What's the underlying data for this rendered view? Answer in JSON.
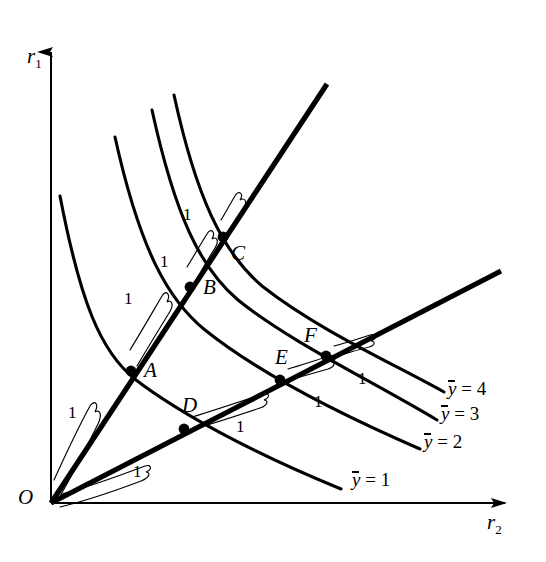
{
  "figure": {
    "type": "isoquant-map-returns-to-scale",
    "background": "#ffffff",
    "ink": "#000000"
  },
  "axes": {
    "y_axis": {
      "name": "vertical-axis",
      "label": "r",
      "sub": "1",
      "label_x": 27,
      "label_y": 46,
      "x": 51,
      "y_top": 36,
      "y_bottom": 503,
      "arrow": "up"
    },
    "x_axis": {
      "name": "horizontal-axis",
      "label": "r",
      "sub": "2",
      "label_x": 487,
      "label_y": 512,
      "x_left": 51,
      "x_right": 520,
      "y": 503,
      "arrow": "right"
    },
    "origin": {
      "label": "O",
      "x": 51,
      "y": 503,
      "label_x": 18,
      "label_y": 487
    }
  },
  "rays": [
    {
      "name": "upper-ray",
      "from": [
        51,
        503
      ],
      "to": [
        327,
        84
      ],
      "width": 5.2
    },
    {
      "name": "lower-ray",
      "from": [
        51,
        503
      ],
      "to": [
        501,
        271
      ],
      "width": 5.2
    }
  ],
  "points": [
    {
      "label": "A",
      "x": 131,
      "y": 371,
      "label_x": 144,
      "label_y": 360,
      "ray": "upper-ray",
      "isoquant": 1
    },
    {
      "label": "B",
      "x": 190,
      "y": 287,
      "label_x": 203,
      "label_y": 277,
      "ray": "upper-ray",
      "isoquant": 2
    },
    {
      "label": "C",
      "x": 223,
      "y": 237,
      "label_x": 231,
      "label_y": 243,
      "ray": "upper-ray",
      "isoquant": 3
    },
    {
      "label": "D",
      "x": 184,
      "y": 429,
      "label_x": 182,
      "label_y": 395,
      "ray": "lower-ray",
      "isoquant": 1
    },
    {
      "label": "E",
      "x": 280,
      "y": 380,
      "label_x": 275,
      "label_y": 347,
      "ray": "lower-ray",
      "isoquant": 2
    },
    {
      "label": "F",
      "x": 326,
      "y": 356,
      "label_x": 304,
      "label_y": 325,
      "ray": "lower-ray",
      "isoquant": 3
    }
  ],
  "isoquants": [
    {
      "level": 1,
      "label_text": "= 1",
      "label_x": 352,
      "label_y": 470,
      "path": "M 60,196 C 80,300 100,352 136,380 C 178,412 250,452 341,489"
    },
    {
      "level": 2,
      "label_text": "= 2",
      "label_x": 424,
      "label_y": 432,
      "path": "M 115,137 C 140,250 168,300 205,330 C 255,370 330,410 420,449"
    },
    {
      "level": 3,
      "label_text": "= 3",
      "label_x": 441,
      "label_y": 404,
      "path": "M 152,110 C 175,215 200,268 238,300 C 290,342 370,380 437,420"
    },
    {
      "level": 4,
      "label_text": "= 4",
      "label_x": 448,
      "label_y": 379,
      "path": "M 174,95 C 196,196 222,252 262,286 C 318,330 390,362 444,392"
    }
  ],
  "distance_brackets": [
    {
      "name": "bracket-O-A",
      "value": "1",
      "label_x": 68,
      "label_y": 404,
      "path": "M 57,501 C 70,480 84,452 98,424 C 103,413 99,409 95,412 C 99,404 95,399 90,406 C 78,428 64,458 54,480"
    },
    {
      "name": "bracket-A-B",
      "value": "1",
      "label_x": 124,
      "label_y": 290,
      "path": "M 137,366 C 147,349 158,331 169,313 C 175,304 171,299 167,302 C 171,294 166,289 162,296 C 152,313 141,332 130,350"
    },
    {
      "name": "bracket-B-C",
      "value": "1",
      "label_x": 160,
      "label_y": 253,
      "path": "M 195,283 C 201,271 208,259 215,248 C 220,240 216,236 212,239 C 216,232 211,227 207,234 C 200,245 194,256 187,267"
    },
    {
      "name": "bracket-C-top",
      "value": "1",
      "label_x": 183,
      "label_y": 206,
      "path": "M 229,234 C 234,225 239,216 244,208 C 248,201 244,197 240,200 C 244,194 239,189 235,196 C 230,204 226,212 221,220"
    },
    {
      "name": "bracket-O-D",
      "value": "1",
      "label_x": 133,
      "label_y": 463,
      "path": "M 60,507 C 85,501 112,492 141,481 C 151,477 150,472 146,472 C 153,469 151,464 145,466 C 116,477 88,487 62,494"
    },
    {
      "name": "bracket-D-E",
      "value": "1",
      "label_x": 236,
      "label_y": 418,
      "path": "M 190,430 C 212,424 236,416 260,408 C 269,405 268,400 264,400 C 271,397 269,392 263,394 C 239,402 215,410 192,417"
    },
    {
      "name": "bracket-E-F",
      "value": "1",
      "label_x": 314,
      "label_y": 393,
      "path": "M 286,381 C 300,377 314,373 328,369 C 336,366 335,362 331,362 C 338,359 336,354 330,356 C 316,360 302,365 288,369"
    },
    {
      "name": "bracket-F-next",
      "value": "1",
      "label_x": 358,
      "label_y": 370,
      "path": "M 333,357 C 345,354 357,350 369,347 C 376,345 375,341 371,341 C 378,338 376,333 370,335 C 358,339 346,343 334,346"
    }
  ],
  "isoquant_common": {
    "y_symbol": "y"
  },
  "chart_data": {
    "type": "line",
    "title": "",
    "xlabel": "r2",
    "ylabel": "r1",
    "series": [
      {
        "name": "ȳ = 1",
        "level": 1
      },
      {
        "name": "ȳ = 2",
        "level": 2
      },
      {
        "name": "ȳ = 3",
        "level": 3
      },
      {
        "name": "ȳ = 4",
        "level": 4
      }
    ],
    "annotations": [
      {
        "point": "A",
        "note": "upper ray, ȳ=1, distance OA = 1"
      },
      {
        "point": "B",
        "note": "upper ray, ȳ=2, distance AB = 1"
      },
      {
        "point": "C",
        "note": "upper ray, ȳ=3, distance BC = 1"
      },
      {
        "point": "D",
        "note": "lower ray, ȳ=1, distance OD = 1"
      },
      {
        "point": "E",
        "note": "lower ray, ȳ=2, distance DE = 1"
      },
      {
        "point": "F",
        "note": "lower ray, ȳ=3, distance EF = 1"
      }
    ],
    "grid": false,
    "legend": "right"
  }
}
